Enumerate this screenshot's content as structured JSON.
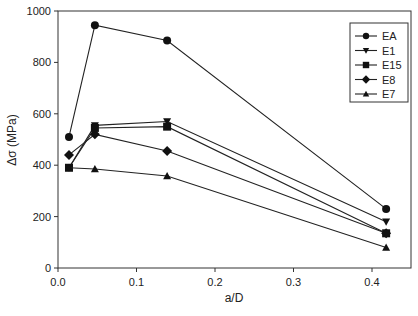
{
  "chart_data": {
    "type": "line",
    "title": "",
    "xlabel": "a/D",
    "ylabel": "Δσ (MPa)",
    "xlim": [
      0.0,
      0.45
    ],
    "ylim": [
      0,
      1000
    ],
    "xticks": [
      0.0,
      0.1,
      0.2,
      0.3,
      0.4
    ],
    "xtick_labels": [
      "0.0",
      "0.1",
      "0.2",
      "0.3",
      "0.4"
    ],
    "yticks": [
      0,
      200,
      400,
      600,
      800,
      1000
    ],
    "ytick_labels": [
      "0",
      "200",
      "400",
      "600",
      "800",
      "1000"
    ],
    "grid": false,
    "legend_position": "upper right",
    "x": [
      0.014,
      0.047,
      0.139,
      0.418
    ],
    "series": [
      {
        "name": "EA",
        "marker": "circle",
        "values": [
          510,
          945,
          885,
          230
        ]
      },
      {
        "name": "E1",
        "marker": "triangle-down",
        "values": [
          390,
          555,
          570,
          180
        ]
      },
      {
        "name": "E15",
        "marker": "square",
        "values": [
          390,
          545,
          550,
          135
        ]
      },
      {
        "name": "E8",
        "marker": "diamond",
        "values": [
          440,
          520,
          455,
          135
        ]
      },
      {
        "name": "E7",
        "marker": "triangle-up",
        "values": [
          390,
          385,
          358,
          80
        ]
      }
    ],
    "colors": {
      "line": "#222222",
      "marker": "#111111",
      "axis": "#333333"
    }
  }
}
